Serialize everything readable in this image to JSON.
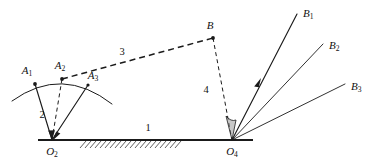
{
  "figure": {
    "type": "mechanism-diagram",
    "background_color": "#ffffff",
    "line_color": "#1a1a1a",
    "shade_color": "#9a9a9a"
  },
  "links": [
    {
      "id": "link1",
      "label": "1",
      "role": "fixed-frame-ground",
      "style": "solid-thick",
      "label_x": 148,
      "label_y": 129
    },
    {
      "id": "link2",
      "label": "2",
      "role": "input-crank",
      "style": "solid",
      "label_x": 42,
      "label_y": 116
    },
    {
      "id": "link3",
      "label": "3",
      "role": "coupler",
      "style": "dashed",
      "label_x": 122,
      "label_y": 53
    },
    {
      "id": "link4",
      "label": "4",
      "role": "output-rocker",
      "style": "dashed",
      "label_x": 206,
      "label_y": 91
    }
  ],
  "joints": [
    {
      "id": "O2",
      "label": "O",
      "subscript": "2",
      "role": "fixed-pivot-input",
      "x": 52,
      "y": 140,
      "label_x": 52,
      "label_y": 152
    },
    {
      "id": "O4",
      "label": "O",
      "subscript": "4",
      "role": "fixed-pivot-output",
      "x": 232,
      "y": 140,
      "label_x": 232,
      "label_y": 152
    },
    {
      "id": "A1",
      "label": "A",
      "subscript": "1",
      "role": "moving-pivot-position-1",
      "x": 35,
      "y": 84,
      "label_x": 27,
      "label_y": 71
    },
    {
      "id": "A2",
      "label": "A",
      "subscript": "2",
      "role": "moving-pivot-position-2",
      "x": 62,
      "y": 79,
      "label_x": 60,
      "label_y": 66
    },
    {
      "id": "A3",
      "label": "A",
      "subscript": "3",
      "role": "moving-pivot-position-3",
      "x": 88,
      "y": 85,
      "label_x": 93,
      "label_y": 76
    },
    {
      "id": "B",
      "label": "B",
      "subscript": "",
      "role": "coupler-output-joint",
      "x": 213,
      "y": 38,
      "label_x": 210,
      "label_y": 26
    }
  ],
  "rays": [
    {
      "id": "rayB1",
      "label": "B",
      "subscript": "1",
      "role": "output-position-1",
      "end_x": 297,
      "end_y": 14,
      "label_x": 303,
      "label_y": 14,
      "has_arrow": true,
      "arrow_x": 258,
      "arrow_y": 84
    },
    {
      "id": "rayB2",
      "label": "B",
      "subscript": "2",
      "role": "output-position-2",
      "end_x": 323,
      "end_y": 44,
      "label_x": 329,
      "label_y": 46,
      "has_arrow": false
    },
    {
      "id": "rayB3",
      "label": "B",
      "subscript": "3",
      "role": "output-position-3",
      "end_x": 345,
      "end_y": 84,
      "label_x": 351,
      "label_y": 87,
      "has_arrow": false
    }
  ],
  "ground": {
    "line_start_x": 38,
    "line_start_y": 140,
    "line_end_x": 253,
    "line_end_y": 140,
    "hatch_start_x": 80,
    "hatch_end_x": 155,
    "hatch_depth": 7
  },
  "arc": {
    "role": "crank-pin-path",
    "start_x": 12,
    "start_y": 101,
    "end_x": 112,
    "end_y": 104,
    "apex_x": 62,
    "apex_y": 77
  },
  "wedge": {
    "role": "output-angle-shaded-sector",
    "apex_x": 232,
    "apex_y": 140,
    "label": ""
  }
}
